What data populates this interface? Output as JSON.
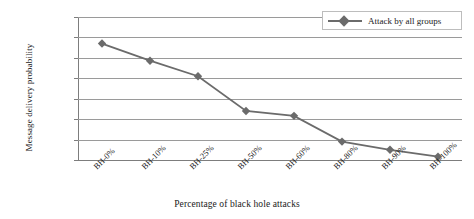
{
  "chart_data": {
    "type": "line",
    "title": "",
    "xlabel": "Percentage of black hole attacks",
    "ylabel": "Message delivery probability",
    "categories": [
      "BH-0%",
      "BH-10%",
      "BH-25%",
      "BH-50%",
      "BH-60%",
      "BH-80%",
      "BH-90%",
      "BH-100%"
    ],
    "series": [
      {
        "name": "Attack by all groups",
        "values": [
          0.285,
          0.243,
          0.205,
          0.12,
          0.108,
          0.045,
          0.025,
          0.008
        ],
        "color": "#6b6b6b",
        "marker": "diamond"
      }
    ],
    "ylim": [
      0,
      0.35
    ],
    "ytick_labels": [
      "0",
      "0.05",
      "0.1",
      "0.15",
      "0.2",
      "0.25",
      "0.3",
      "0.35"
    ],
    "ytick_values": [
      0,
      0.05,
      0.1,
      0.15,
      0.2,
      0.25,
      0.3,
      0.35
    ],
    "grid": true,
    "legend_position": "top-right",
    "legend_entries": [
      "Attack by all groups"
    ]
  },
  "colors": {
    "series": "#6b6b6b",
    "gridline": "#9a9a9a",
    "axis": "#7d7d7d",
    "text": "#1a1a1a",
    "background": "#ffffff",
    "legend_border": "#bdbdbd"
  }
}
